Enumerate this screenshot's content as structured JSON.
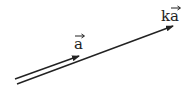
{
  "diagram": {
    "type": "vector-scalar-multiplication",
    "background": "#ffffff",
    "line_color": "#222222",
    "vectors": [
      {
        "id": "a",
        "label_prefix": "",
        "label_symbol": "a",
        "start": [
          15,
          79
        ],
        "end": [
          79,
          56
        ]
      },
      {
        "id": "ka",
        "label_prefix": "k",
        "label_symbol": "a",
        "start": [
          17,
          84
        ],
        "end": [
          173,
          26
        ]
      }
    ]
  }
}
